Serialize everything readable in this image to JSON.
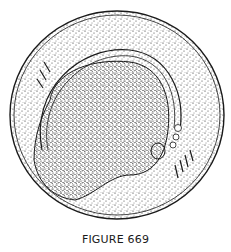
{
  "figure": {
    "caption": "FIGURE 669",
    "colors": {
      "ink": "#1a1a1a",
      "paper": "#ffffff"
    }
  }
}
